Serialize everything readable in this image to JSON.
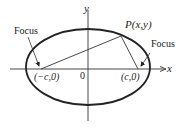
{
  "diagram": {
    "type": "ellipse-with-foci",
    "axes": {
      "x_label": "x",
      "y_label": "y",
      "origin_label": "0"
    },
    "foci": [
      {
        "label": "Focus",
        "coord_label": "(−c,0)"
      },
      {
        "label": "Focus",
        "coord_label": "(c,0)"
      }
    ],
    "point": {
      "label": "P(x,y)"
    },
    "colors": {
      "stroke": "#222222",
      "background": "#ffffff"
    }
  }
}
